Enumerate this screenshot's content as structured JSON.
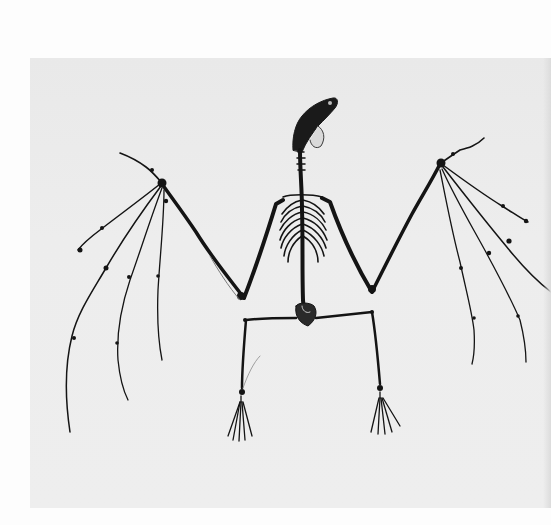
{
  "image": {
    "subject": "Bat skeleton with wings spread, photographed on a light gray background",
    "alt": "Bat skeleton specimen with outstretched wings",
    "colors": {
      "page_background": "#fdfdfd",
      "photo_background": "#ececec",
      "bone": "#141414",
      "bone_faint": "#6a6a6a"
    },
    "parts": [
      "skull",
      "spine",
      "rib-cage",
      "left-wing",
      "right-wing",
      "pelvis",
      "left-leg",
      "right-leg",
      "left-foot",
      "right-foot"
    ]
  }
}
